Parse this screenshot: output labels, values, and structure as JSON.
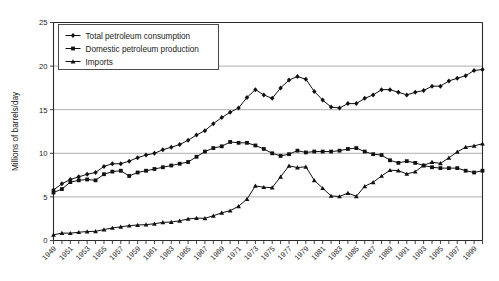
{
  "chart_data": {
    "type": "line",
    "title": "",
    "xlabel": "",
    "ylabel": "Millions of barrels/day",
    "ylim": [
      0,
      25
    ],
    "yticks": [
      0,
      5,
      10,
      15,
      20,
      25
    ],
    "grid": "horizontal",
    "legend_position": "top-left",
    "xlim": [
      1949,
      2000
    ],
    "x": [
      1949,
      1950,
      1951,
      1952,
      1953,
      1954,
      1955,
      1956,
      1957,
      1958,
      1959,
      1960,
      1961,
      1962,
      1963,
      1964,
      1965,
      1966,
      1967,
      1968,
      1969,
      1970,
      1971,
      1972,
      1973,
      1974,
      1975,
      1976,
      1977,
      1978,
      1979,
      1980,
      1981,
      1982,
      1983,
      1984,
      1985,
      1986,
      1987,
      1988,
      1989,
      1990,
      1991,
      1992,
      1993,
      1994,
      1995,
      1996,
      1997,
      1998,
      1999,
      2000
    ],
    "xticks": [
      1949,
      1951,
      1953,
      1955,
      1957,
      1959,
      1961,
      1963,
      1965,
      1967,
      1969,
      1971,
      1973,
      1975,
      1977,
      1979,
      1981,
      1983,
      1985,
      1987,
      1989,
      1991,
      1993,
      1995,
      1997,
      1999
    ],
    "xtick_labels": [
      "1949",
      "1951",
      "1953",
      "1955",
      "1957",
      "1959",
      "1961",
      "1963",
      "1965",
      "1967",
      "1969",
      "1971",
      "1973",
      "1975",
      "1977",
      "1979",
      "1981",
      "1983",
      "1985",
      "1987",
      "1989",
      "1991",
      "1993",
      "1995",
      "1997",
      "1999"
    ],
    "series": [
      {
        "name": "Total petroleum consumption",
        "marker": "diamond",
        "color": "#111111",
        "values": [
          5.8,
          6.5,
          7.0,
          7.3,
          7.6,
          7.8,
          8.5,
          8.8,
          8.8,
          9.1,
          9.5,
          9.8,
          10.0,
          10.4,
          10.7,
          11.0,
          11.5,
          12.1,
          12.6,
          13.4,
          14.1,
          14.7,
          15.2,
          16.4,
          17.3,
          16.7,
          16.3,
          17.5,
          18.4,
          18.8,
          18.5,
          17.1,
          16.1,
          15.3,
          15.2,
          15.7,
          15.7,
          16.3,
          16.7,
          17.3,
          17.3,
          17.0,
          16.7,
          17.0,
          17.2,
          17.7,
          17.7,
          18.3,
          18.6,
          18.9,
          19.5,
          19.6
        ]
      },
      {
        "name": "Domestic petroleum production",
        "marker": "square",
        "color": "#111111",
        "values": [
          5.5,
          5.9,
          6.7,
          6.9,
          7.0,
          6.9,
          7.6,
          7.9,
          8.0,
          7.4,
          7.8,
          8.0,
          8.2,
          8.4,
          8.6,
          8.8,
          9.0,
          9.6,
          10.2,
          10.6,
          10.8,
          11.3,
          11.2,
          11.2,
          10.9,
          10.5,
          10.0,
          9.7,
          9.9,
          10.3,
          10.1,
          10.2,
          10.2,
          10.2,
          10.3,
          10.5,
          10.6,
          10.2,
          9.9,
          9.8,
          9.2,
          8.9,
          9.1,
          8.9,
          8.6,
          8.4,
          8.3,
          8.3,
          8.3,
          8.0,
          7.8,
          8.0
        ]
      },
      {
        "name": "Imports",
        "marker": "triangle",
        "color": "#111111",
        "values": [
          0.65,
          0.85,
          0.84,
          0.95,
          1.03,
          1.05,
          1.25,
          1.44,
          1.57,
          1.7,
          1.78,
          1.82,
          1.92,
          2.08,
          2.12,
          2.26,
          2.47,
          2.57,
          2.54,
          2.84,
          3.17,
          3.42,
          3.93,
          4.74,
          6.26,
          6.11,
          6.06,
          7.31,
          8.57,
          8.36,
          8.46,
          6.91,
          6.0,
          5.11,
          5.05,
          5.44,
          5.07,
          6.22,
          6.68,
          7.4,
          8.06,
          8.02,
          7.63,
          7.89,
          8.62,
          8.99,
          8.84,
          9.48,
          10.16,
          10.71,
          10.85,
          11.1
        ]
      }
    ]
  }
}
